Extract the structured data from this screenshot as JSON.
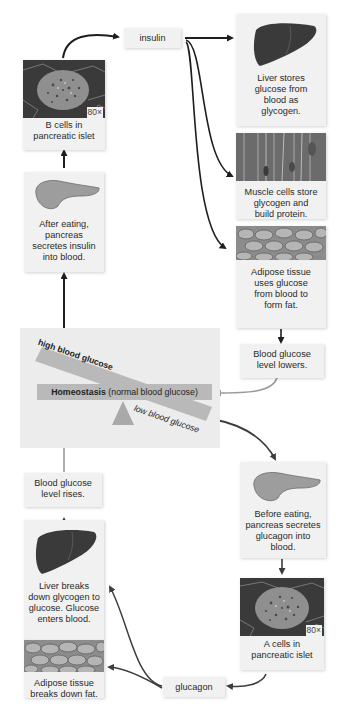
{
  "diagram": {
    "colors": {
      "box_bg": "#f1f1f1",
      "panel_bg": "#ececec",
      "seesaw": "#b9b9b9",
      "fulcrum": "#a9a9a9",
      "arrow_dark": "#1e1e1e",
      "arrow_gray": "#9a9a9a",
      "arrow_glucagon": "#3d3d3d"
    },
    "nodes": {
      "insulin": {
        "label": "insulin"
      },
      "glucagon": {
        "label": "glucagon"
      },
      "b_cells": {
        "label": "B cells in pancreatic islet",
        "line1": "B cells in",
        "line2": "pancreatic islet",
        "magnification": "80×"
      },
      "a_cells": {
        "label": "A cells in pancreatic islet",
        "line1": "A cells in",
        "line2": "pancreatic islet",
        "magnification": "80×"
      },
      "pancreas_after": {
        "text": "After eating, pancreas secretes insulin into blood."
      },
      "pancreas_before": {
        "text": "Before eating, pancreas secretes glucagon into blood."
      },
      "liver_stores": {
        "text": "Liver stores glucose from blood as glycogen."
      },
      "muscle": {
        "text": "Muscle cells store glycogen and build protein."
      },
      "adipose_uses": {
        "text": "Adipose tissue uses glucose from blood to form fat."
      },
      "glucose_lowers": {
        "text": "Blood glucose level lowers."
      },
      "glucose_rises": {
        "text": "Blood glucose level rises."
      },
      "liver_breaks": {
        "text": "Liver breaks down glycogen to glucose. Glucose enters blood."
      },
      "adipose_breaks": {
        "text": "Adipose tissue breaks down fat."
      }
    },
    "seesaw": {
      "homeostasis_bold": "Homeostasis",
      "homeostasis_rest": " (normal blood glucose)",
      "high_label": "high blood glucose",
      "low_label": "low blood glucose"
    },
    "edges": [
      {
        "from": "b_cells",
        "to": "insulin"
      },
      {
        "from": "insulin",
        "to": "liver_stores"
      },
      {
        "from": "insulin",
        "to": "muscle"
      },
      {
        "from": "insulin",
        "to": "adipose_uses"
      },
      {
        "from": "adipose_uses",
        "to": "glucose_lowers"
      },
      {
        "from": "glucose_lowers",
        "to": "homeostasis"
      },
      {
        "from": "high_blood_glucose",
        "to": "pancreas_after"
      },
      {
        "from": "pancreas_after",
        "to": "b_cells"
      },
      {
        "from": "low_blood_glucose",
        "to": "pancreas_before"
      },
      {
        "from": "pancreas_before",
        "to": "a_cells"
      },
      {
        "from": "a_cells",
        "to": "glucagon"
      },
      {
        "from": "glucagon",
        "to": "liver_breaks"
      },
      {
        "from": "glucagon",
        "to": "adipose_breaks"
      },
      {
        "from": "liver_breaks",
        "to": "glucose_rises"
      },
      {
        "from": "glucose_rises",
        "to": "homeostasis"
      }
    ]
  }
}
